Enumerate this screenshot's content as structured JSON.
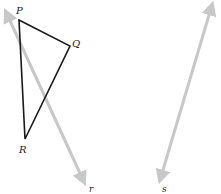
{
  "diagram": {
    "type": "geometry",
    "colors": {
      "triangle": "#1a1a1a",
      "line": "#c8c8c8",
      "label": "#222222",
      "background": "#ffffff"
    },
    "triangle": {
      "vertices": [
        {
          "name": "P",
          "x": 19,
          "y": 20,
          "label_x": 16,
          "label_y": 14
        },
        {
          "name": "Q",
          "x": 70,
          "y": 46,
          "label_x": 72,
          "label_y": 47
        },
        {
          "name": "R",
          "x": 25,
          "y": 139,
          "label_x": 19,
          "label_y": 153
        }
      ]
    },
    "lines": [
      {
        "name": "r",
        "x1": 6,
        "y1": 12,
        "x2": 84,
        "y2": 182,
        "label_x": 89,
        "label_y": 192
      },
      {
        "name": "s",
        "x1": 212,
        "y1": 5,
        "x2": 160,
        "y2": 180,
        "label_x": 162,
        "label_y": 192
      }
    ],
    "labels": {
      "P": "P",
      "Q": "Q",
      "R": "R",
      "r": "r",
      "s": "s"
    }
  }
}
